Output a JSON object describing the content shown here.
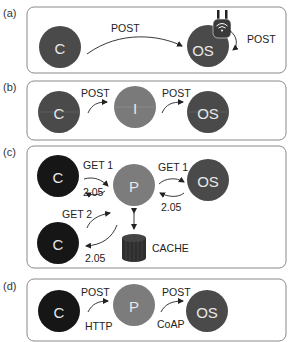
{
  "colors": {
    "client_black": "#161616",
    "origin_server": "#4a4a4a",
    "intermediary": "#7a7a7a",
    "proxy": "#7c7c7c",
    "client_dark": "#464646",
    "cache": "#2e2e2e",
    "frame": "#8a8a8a"
  },
  "panels": [
    {
      "label": "(a)",
      "nodes": [
        {
          "id": "C",
          "text": "C"
        },
        {
          "id": "OS",
          "text": "OS"
        }
      ],
      "edges": [
        {
          "label": "POST"
        },
        {
          "label": "POST"
        }
      ],
      "device_icon": "wifi-router-icon"
    },
    {
      "label": "(b)",
      "nodes": [
        {
          "id": "C",
          "text": "C"
        },
        {
          "id": "I",
          "text": "I"
        },
        {
          "id": "OS",
          "text": "OS"
        }
      ],
      "edges": [
        {
          "label": "POST"
        },
        {
          "label": "POST"
        }
      ]
    },
    {
      "label": "(c)",
      "nodes": [
        {
          "id": "C1",
          "text": "C"
        },
        {
          "id": "P",
          "text": "P"
        },
        {
          "id": "OS",
          "text": "OS"
        },
        {
          "id": "C2",
          "text": "C"
        },
        {
          "id": "CACHE",
          "text": "CACHE"
        }
      ],
      "edges": [
        {
          "label": "GET 1"
        },
        {
          "label": "2.05"
        },
        {
          "label": "GET 1"
        },
        {
          "label": "2.05"
        },
        {
          "label": "GET 2"
        },
        {
          "label": "2.05"
        }
      ]
    },
    {
      "label": "(d)",
      "nodes": [
        {
          "id": "C",
          "text": "C"
        },
        {
          "id": "P",
          "text": "P"
        },
        {
          "id": "OS",
          "text": "OS"
        }
      ],
      "edges": [
        {
          "label": "POST",
          "protocol": "HTTP"
        },
        {
          "label": "POST",
          "protocol": "CoAP"
        }
      ]
    }
  ]
}
